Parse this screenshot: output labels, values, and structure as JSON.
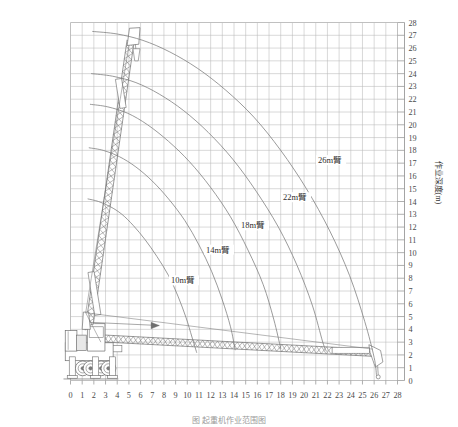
{
  "figure": {
    "title": "",
    "caption": "图 起重机作业范围图",
    "background": "#ffffff",
    "grid_color": "#b9b9b9",
    "curve_color": "#7a7a7a",
    "machine_color": "#6e6e6e"
  },
  "chart_data": {
    "type": "line",
    "title": "",
    "subtitle": "",
    "xlabel": "",
    "ylabel": "作业深度(m)",
    "xlim": [
      0,
      28
    ],
    "ylim": [
      0,
      28
    ],
    "grid": true,
    "grid_step": 1,
    "legend_position": "inline-annotations",
    "x_ticks": [
      0,
      1,
      2,
      3,
      4,
      5,
      6,
      7,
      8,
      9,
      10,
      11,
      12,
      13,
      14,
      15,
      16,
      17,
      18,
      19,
      20,
      21,
      22,
      23,
      24,
      25,
      26,
      27,
      28
    ],
    "y_ticks": [
      0,
      1,
      2,
      3,
      4,
      5,
      6,
      7,
      8,
      9,
      10,
      11,
      12,
      13,
      14,
      15,
      16,
      17,
      18,
      19,
      20,
      21,
      22,
      23,
      24,
      25,
      26,
      27,
      28
    ],
    "y_axis_side": "right",
    "pivot": {
      "x": 1.3,
      "y": 4.4
    },
    "series": [
      {
        "name": "10m臂",
        "label": "10m臂",
        "boom_length_m": 10,
        "label_at": {
          "x": 8.6,
          "y": 7.6
        },
        "points": [
          [
            1.5,
            14.2
          ],
          [
            2.4,
            14.0
          ],
          [
            3.4,
            13.6
          ],
          [
            4.4,
            13.0
          ],
          [
            5.4,
            12.1
          ],
          [
            6.4,
            11.0
          ],
          [
            7.4,
            9.7
          ],
          [
            8.4,
            8.2
          ],
          [
            9.2,
            6.6
          ],
          [
            9.9,
            4.9
          ],
          [
            10.4,
            3.4
          ],
          [
            10.8,
            2.2
          ]
        ]
      },
      {
        "name": "14m臂",
        "label": "14m臂",
        "boom_length_m": 14,
        "label_at": {
          "x": 11.6,
          "y": 10.0
        },
        "points": [
          [
            1.6,
            18.2
          ],
          [
            2.8,
            18.0
          ],
          [
            4.2,
            17.5
          ],
          [
            5.6,
            16.7
          ],
          [
            7.0,
            15.6
          ],
          [
            8.4,
            14.2
          ],
          [
            9.8,
            12.5
          ],
          [
            11.0,
            10.6
          ],
          [
            12.1,
            8.5
          ],
          [
            13.0,
            6.3
          ],
          [
            13.7,
            4.2
          ],
          [
            14.1,
            2.4
          ]
        ]
      },
      {
        "name": "18m臂",
        "label": "18m臂",
        "boom_length_m": 18,
        "label_at": {
          "x": 14.6,
          "y": 11.9
        },
        "points": [
          [
            1.7,
            21.6
          ],
          [
            3.2,
            21.4
          ],
          [
            4.9,
            20.9
          ],
          [
            6.6,
            20.0
          ],
          [
            8.4,
            18.7
          ],
          [
            10.2,
            17.1
          ],
          [
            12.0,
            15.1
          ],
          [
            13.7,
            12.8
          ],
          [
            15.2,
            10.2
          ],
          [
            16.5,
            7.5
          ],
          [
            17.4,
            4.8
          ],
          [
            18.0,
            2.5
          ]
        ]
      },
      {
        "name": "22m臂",
        "label": "22m臂",
        "boom_length_m": 22,
        "label_at": {
          "x": 18.2,
          "y": 14.1
        },
        "points": [
          [
            1.8,
            24.0
          ],
          [
            3.6,
            23.8
          ],
          [
            5.6,
            23.3
          ],
          [
            7.6,
            22.4
          ],
          [
            9.7,
            21.1
          ],
          [
            11.8,
            19.4
          ],
          [
            13.9,
            17.3
          ],
          [
            15.9,
            14.8
          ],
          [
            17.8,
            12.0
          ],
          [
            19.4,
            9.0
          ],
          [
            20.7,
            5.9
          ],
          [
            21.6,
            3.0
          ],
          [
            21.9,
            2.3
          ]
        ]
      },
      {
        "name": "26m臂",
        "label": "26m臂",
        "boom_length_m": 26,
        "label_at": {
          "x": 21.2,
          "y": 17.0
        },
        "points": [
          [
            1.9,
            27.3
          ],
          [
            4.0,
            27.1
          ],
          [
            6.2,
            26.6
          ],
          [
            8.5,
            25.7
          ],
          [
            10.9,
            24.4
          ],
          [
            13.3,
            22.7
          ],
          [
            15.7,
            20.6
          ],
          [
            18.0,
            18.0
          ],
          [
            20.2,
            15.0
          ],
          [
            22.2,
            11.7
          ],
          [
            23.9,
            8.2
          ],
          [
            25.2,
            4.6
          ],
          [
            26.0,
            1.8
          ],
          [
            26.2,
            0.4
          ]
        ]
      }
    ],
    "annotations": [
      {
        "text": "10m臂",
        "x": 8.6,
        "y": 7.6
      },
      {
        "text": "14m臂",
        "x": 11.6,
        "y": 10.0
      },
      {
        "text": "18m臂",
        "x": 14.6,
        "y": 11.9
      },
      {
        "text": "22m臂",
        "x": 18.2,
        "y": 14.1
      },
      {
        "text": "26m臂",
        "x": 21.2,
        "y": 17.0
      }
    ]
  },
  "machine": {
    "raised_boom": {
      "base": {
        "x": 1.3,
        "y": 4.4
      },
      "tip": {
        "x": 5.3,
        "y": 27.4
      },
      "description": "lattice-boom-raised"
    },
    "lowered_boom": {
      "base": {
        "x": 1.3,
        "y": 3.6
      },
      "tip": {
        "x": 26.3,
        "y": 2.1
      },
      "description": "lattice-boom-lowered"
    },
    "hook_raised": {
      "x": 5.5,
      "y": 25.6
    },
    "hook_lowered": {
      "x": 26.4,
      "y": 0.3
    }
  }
}
